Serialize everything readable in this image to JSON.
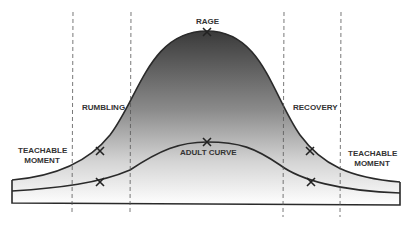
{
  "diagram": {
    "labels": {
      "rage": "RAGE",
      "rumbling": "RUMBLING",
      "recovery": "RECOVERY",
      "adult_curve": "ADULT CURVE",
      "teachable_left_1": "TEACHABLE",
      "teachable_left_2": "MOMENT",
      "teachable_right_1": "TEACHABLE",
      "teachable_right_2": "MOMENT"
    },
    "markers": [
      "X",
      "X",
      "X",
      "X",
      "X",
      "X"
    ],
    "colors": {
      "stroke": "#2a2a2a",
      "peak_fill": "#3a3a3a",
      "base_fill": "#ffffff",
      "dash": "#555555"
    }
  }
}
